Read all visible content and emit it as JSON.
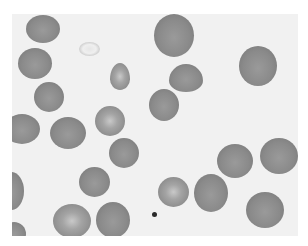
{
  "image": {
    "subject": "blood smear micrograph of red blood cells",
    "palette": {
      "background": "#f1f1f1",
      "border": "#ffffff",
      "cell": "#8a8a8a",
      "cell_edge": "#7c7c7c",
      "pale_center": "#c9c9c9",
      "platelet": "#2a2a2a"
    }
  },
  "cells": [
    {
      "x": 14,
      "y": 1,
      "w": 34,
      "h": 28,
      "type": "normal"
    },
    {
      "x": 67,
      "y": 28,
      "w": 21,
      "h": 14,
      "type": "ghost"
    },
    {
      "x": 142,
      "y": 0,
      "w": 40,
      "h": 43,
      "type": "normal"
    },
    {
      "x": 6,
      "y": 34,
      "w": 34,
      "h": 31,
      "type": "normal"
    },
    {
      "x": 98,
      "y": 49,
      "w": 20,
      "h": 27,
      "type": "pale",
      "shape": "tear"
    },
    {
      "x": 157,
      "y": 50,
      "w": 34,
      "h": 28,
      "type": "normal",
      "shape": "tear"
    },
    {
      "x": 227,
      "y": 32,
      "w": 38,
      "h": 40,
      "type": "normal"
    },
    {
      "x": 22,
      "y": 68,
      "w": 30,
      "h": 30,
      "type": "normal"
    },
    {
      "x": 137,
      "y": 75,
      "w": 30,
      "h": 32,
      "type": "normal"
    },
    {
      "x": -8,
      "y": 100,
      "w": 36,
      "h": 30,
      "type": "normal"
    },
    {
      "x": 38,
      "y": 103,
      "w": 36,
      "h": 32,
      "type": "normal"
    },
    {
      "x": 83,
      "y": 92,
      "w": 30,
      "h": 30,
      "type": "pale"
    },
    {
      "x": 97,
      "y": 124,
      "w": 30,
      "h": 30,
      "type": "normal"
    },
    {
      "x": 205,
      "y": 130,
      "w": 36,
      "h": 34,
      "type": "normal"
    },
    {
      "x": 248,
      "y": 124,
      "w": 38,
      "h": 36,
      "type": "normal"
    },
    {
      "x": -14,
      "y": 158,
      "w": 26,
      "h": 38,
      "type": "normal"
    },
    {
      "x": 67,
      "y": 153,
      "w": 31,
      "h": 30,
      "type": "normal"
    },
    {
      "x": 146,
      "y": 163,
      "w": 31,
      "h": 30,
      "type": "pale"
    },
    {
      "x": 182,
      "y": 160,
      "w": 34,
      "h": 38,
      "type": "normal"
    },
    {
      "x": 41,
      "y": 190,
      "w": 38,
      "h": 34,
      "type": "pale"
    },
    {
      "x": 84,
      "y": 188,
      "w": 34,
      "h": 36,
      "type": "normal"
    },
    {
      "x": 234,
      "y": 178,
      "w": 38,
      "h": 36,
      "type": "normal"
    },
    {
      "x": -10,
      "y": 208,
      "w": 24,
      "h": 24,
      "type": "normal"
    }
  ],
  "platelet": {
    "x": 140,
    "y": 198,
    "w": 5,
    "h": 5
  }
}
